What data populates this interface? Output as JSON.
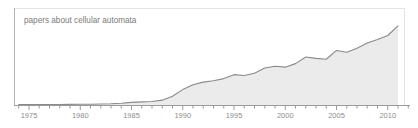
{
  "chart_data": {
    "type": "area",
    "title": "papers about cellular automata",
    "xlabel": "",
    "ylabel": "",
    "grid": false,
    "legend": "none",
    "xlim": [
      1973,
      2012
    ],
    "ylim": [
      0,
      1
    ],
    "x_major_ticks": [
      1975,
      1980,
      1985,
      1990,
      1995,
      2000,
      2005,
      2010
    ],
    "x_major_tick_labels": [
      "1975",
      "1980",
      "1985",
      "1990",
      "1995",
      "2000",
      "2005",
      "2010"
    ],
    "x_minor_tick_interval": 1,
    "y_axis_visible": false,
    "x": [
      1973,
      1974,
      1975,
      1976,
      1977,
      1978,
      1979,
      1980,
      1981,
      1982,
      1983,
      1984,
      1985,
      1986,
      1987,
      1988,
      1989,
      1990,
      1991,
      1992,
      1993,
      1994,
      1995,
      1996,
      1997,
      1998,
      1999,
      2000,
      2001,
      2002,
      2003,
      2004,
      2005,
      2006,
      2007,
      2008,
      2009,
      2010,
      2011
    ],
    "values": [
      0.004,
      0.004,
      0.005,
      0.005,
      0.006,
      0.006,
      0.007,
      0.008,
      0.009,
      0.011,
      0.014,
      0.02,
      0.03,
      0.035,
      0.04,
      0.055,
      0.1,
      0.175,
      0.23,
      0.26,
      0.275,
      0.3,
      0.345,
      0.335,
      0.36,
      0.42,
      0.44,
      0.43,
      0.47,
      0.545,
      0.53,
      0.52,
      0.62,
      0.6,
      0.645,
      0.705,
      0.745,
      0.79,
      0.9
    ],
    "series": [
      {
        "name": "papers about cellular automata",
        "line_color": "#8a8a8a",
        "fill_color": "#ebebeb"
      }
    ]
  },
  "axis": {
    "line_color": "#9a9a9a",
    "frame_color": "#e4e4e4"
  },
  "labels": {
    "tick_1975": "1975",
    "tick_1980": "1980",
    "tick_1985": "1985",
    "tick_1990": "1990",
    "tick_1995": "1995",
    "tick_2000": "2000",
    "tick_2005": "2005",
    "tick_2010": "2010"
  }
}
